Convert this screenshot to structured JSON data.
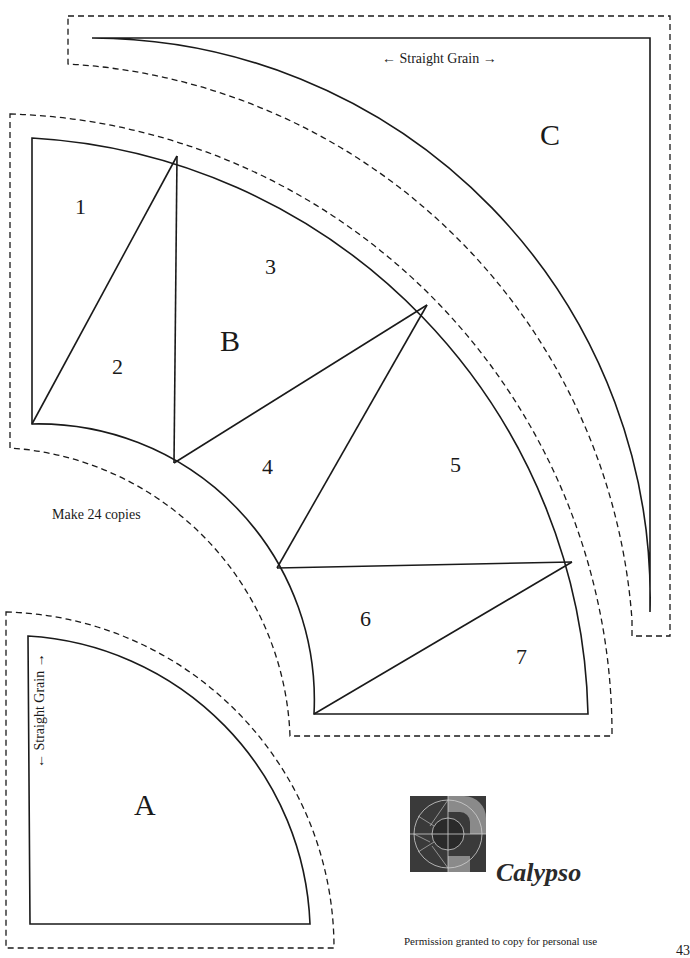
{
  "page": {
    "page_number": "43"
  },
  "templates": {
    "A": {
      "label": "A",
      "grain_label": "Straight Grain"
    },
    "B": {
      "label": "B",
      "sections": [
        "1",
        "2",
        "3",
        "4",
        "5",
        "6",
        "7"
      ],
      "note": "Make 24 copies"
    },
    "C": {
      "label": "C",
      "grain_label": "Straight Grain"
    }
  },
  "grain": {
    "left_arrow": "←",
    "right_arrow": "→",
    "up_arrow": "↑",
    "down_arrow": "↓"
  },
  "brand": {
    "name": "Calypso",
    "logo_icon": "calypso-quilt-block-icon"
  },
  "footer": {
    "permission": "Permission granted to copy for personal use"
  },
  "colors": {
    "line": "#1a1a1a",
    "logo_dark": "#3a3a3a",
    "logo_mid": "#8a8a8a",
    "background": "#ffffff"
  }
}
